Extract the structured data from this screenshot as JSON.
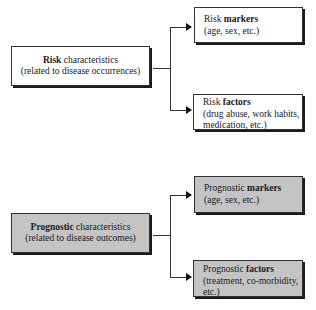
{
  "risk_group": {
    "main": {
      "bold": "Risk",
      "rest": " characteristics",
      "sub": "(related to disease occurrences)"
    },
    "markers": {
      "prefix": "Risk ",
      "bold": "markers",
      "sub": "(age, sex, etc.)"
    },
    "factors": {
      "prefix": "Risk ",
      "bold": "factors",
      "sub1": "(drug abuse, work habits,",
      "sub2": "medication, etc.)"
    }
  },
  "prognostic_group": {
    "main": {
      "bold": "Prognostic",
      "rest": " characteristics",
      "sub": "(related to disease outcomes)"
    },
    "markers": {
      "prefix": "Prognostic ",
      "bold": "markers",
      "sub": "(age, sex, etc.)"
    },
    "factors": {
      "prefix": "Prognostic ",
      "bold": "factors",
      "sub1": "(treatment, co-morbidity,",
      "sub2": "etc.)"
    }
  },
  "colors": {
    "white_box": "#ffffff",
    "gray_box": "#c4c4c4",
    "line": "#333333"
  }
}
